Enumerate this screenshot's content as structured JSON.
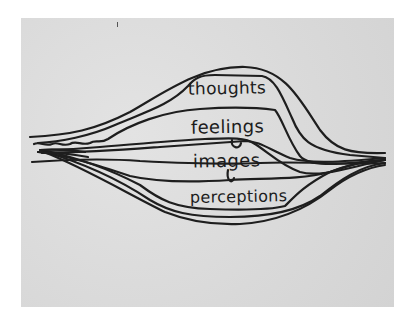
{
  "diagram": {
    "type": "hand-drawn layered lens diagram",
    "background_color": "#ffffff",
    "paper_color": "#dcdcdc",
    "ink_color": "#1e1e1e",
    "labels": [
      {
        "id": "thoughts",
        "text": "thoughts"
      },
      {
        "id": "feelings",
        "text": "feelings"
      },
      {
        "id": "images",
        "text": "images"
      },
      {
        "id": "perceptions",
        "text": "perceptions"
      }
    ],
    "layer_order_top_to_bottom": [
      "thoughts",
      "feelings",
      "images",
      "perceptions"
    ]
  }
}
